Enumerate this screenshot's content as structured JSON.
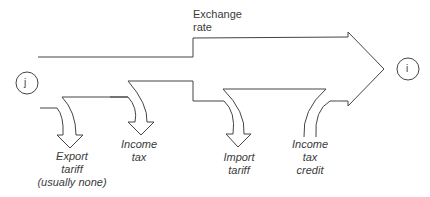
{
  "diagram": {
    "type": "flow-arrows",
    "nodes": {
      "source": {
        "label": "j"
      },
      "target": {
        "label": "i"
      }
    },
    "main_flow": {
      "label_line1": "Exchange",
      "label_line2": "rate"
    },
    "outflows": [
      {
        "id": "export-tariff",
        "lines": [
          "Export",
          "tariff",
          "(usually none)"
        ]
      },
      {
        "id": "income-tax",
        "lines": [
          "Income",
          "tax"
        ]
      },
      {
        "id": "import-tariff",
        "lines": [
          "Import",
          "tariff"
        ]
      }
    ],
    "inflows": [
      {
        "id": "income-tax-credit",
        "lines": [
          "Income",
          "tax",
          "credit"
        ]
      }
    ],
    "colors": {
      "stroke": "#444444",
      "text": "#3a3a3a",
      "background": "#ffffff"
    }
  }
}
